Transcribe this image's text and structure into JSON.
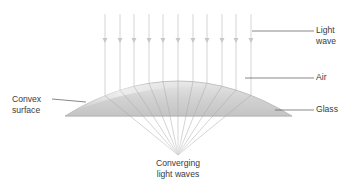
{
  "diagram": {
    "labels": {
      "light_wave": {
        "line1": "Light",
        "line2": "wave"
      },
      "air": "Air",
      "glass": "Glass",
      "convex_surface": {
        "line1": "Convex",
        "line2": "surface"
      },
      "converging": {
        "line1": "Converging",
        "line2": "light waves"
      }
    },
    "rays": {
      "count": 11,
      "x_positions": [
        105,
        120,
        134,
        149,
        163,
        178,
        193,
        207,
        222,
        236,
        251
      ],
      "top_y": 14,
      "arrowhead_y": 42,
      "focal_point": [
        178,
        155
      ]
    },
    "lens": {
      "left_x": 65,
      "right_x": 292,
      "base_y": 116,
      "apex_y": 81
    },
    "colors": {
      "ray": "#d4d4d4",
      "arrowhead": "#c8c8c8",
      "glass_fill": "#cfcfcf",
      "glass_highlight": "#ececec",
      "glass_edge": "#b0b0b0",
      "leader_line": "#555555",
      "text": "#3a3a3a"
    }
  }
}
